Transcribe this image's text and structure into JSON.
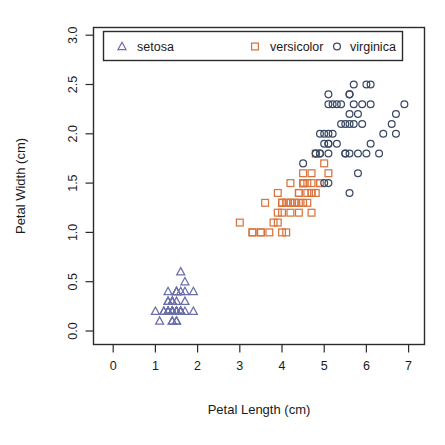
{
  "chart_data": {
    "type": "scatter",
    "title": "",
    "xlabel": "Petal Length (cm)",
    "ylabel": "Petal Width (cm)",
    "xlim": [
      -0.15,
      7.6
    ],
    "ylim": [
      -0.18,
      3.15
    ],
    "xticks": [
      "0",
      "1",
      "2",
      "3",
      "4",
      "5",
      "6",
      "7"
    ],
    "xtick_values": [
      0,
      1,
      2,
      3,
      4,
      5,
      6,
      7
    ],
    "yticks": [
      "0.0",
      "0.5",
      "1.0",
      "1.5",
      "2.0",
      "2.5",
      "3.0"
    ],
    "ytick_values": [
      0.0,
      0.5,
      1.0,
      1.5,
      2.0,
      2.5,
      3.0
    ],
    "grid": false,
    "legend_position": "top-inside",
    "legend_entries": [
      {
        "label": "setosa",
        "marker": "triangle",
        "color": "#6b6fa8"
      },
      {
        "label": "versicolor",
        "marker": "square",
        "color": "#d9743f"
      },
      {
        "label": "virginica",
        "marker": "circle",
        "color": "#3b4a63"
      }
    ],
    "series": [
      {
        "name": "setosa",
        "marker": "triangle",
        "color": "#6b6fa8",
        "points": [
          [
            1.4,
            0.2
          ],
          [
            1.4,
            0.2
          ],
          [
            1.3,
            0.2
          ],
          [
            1.5,
            0.2
          ],
          [
            1.4,
            0.2
          ],
          [
            1.7,
            0.4
          ],
          [
            1.4,
            0.3
          ],
          [
            1.5,
            0.2
          ],
          [
            1.4,
            0.2
          ],
          [
            1.5,
            0.1
          ],
          [
            1.5,
            0.2
          ],
          [
            1.6,
            0.2
          ],
          [
            1.4,
            0.1
          ],
          [
            1.1,
            0.1
          ],
          [
            1.2,
            0.2
          ],
          [
            1.5,
            0.4
          ],
          [
            1.3,
            0.4
          ],
          [
            1.4,
            0.3
          ],
          [
            1.7,
            0.3
          ],
          [
            1.5,
            0.3
          ],
          [
            1.7,
            0.2
          ],
          [
            1.5,
            0.4
          ],
          [
            1.0,
            0.2
          ],
          [
            1.7,
            0.5
          ],
          [
            1.9,
            0.2
          ],
          [
            1.6,
            0.2
          ],
          [
            1.6,
            0.4
          ],
          [
            1.5,
            0.2
          ],
          [
            1.4,
            0.2
          ],
          [
            1.6,
            0.2
          ],
          [
            1.6,
            0.2
          ],
          [
            1.5,
            0.4
          ],
          [
            1.5,
            0.1
          ],
          [
            1.4,
            0.2
          ],
          [
            1.5,
            0.2
          ],
          [
            1.2,
            0.2
          ],
          [
            1.3,
            0.2
          ],
          [
            1.4,
            0.1
          ],
          [
            1.3,
            0.2
          ],
          [
            1.5,
            0.2
          ],
          [
            1.3,
            0.3
          ],
          [
            1.3,
            0.3
          ],
          [
            1.3,
            0.2
          ],
          [
            1.6,
            0.6
          ],
          [
            1.9,
            0.4
          ],
          [
            1.4,
            0.3
          ],
          [
            1.6,
            0.2
          ],
          [
            1.4,
            0.2
          ],
          [
            1.5,
            0.2
          ],
          [
            1.4,
            0.2
          ]
        ]
      },
      {
        "name": "versicolor",
        "marker": "square",
        "color": "#d9743f",
        "points": [
          [
            4.7,
            1.4
          ],
          [
            4.5,
            1.5
          ],
          [
            4.9,
            1.5
          ],
          [
            4.0,
            1.3
          ],
          [
            4.6,
            1.5
          ],
          [
            4.5,
            1.3
          ],
          [
            4.7,
            1.6
          ],
          [
            3.3,
            1.0
          ],
          [
            4.6,
            1.3
          ],
          [
            3.9,
            1.4
          ],
          [
            3.5,
            1.0
          ],
          [
            4.2,
            1.5
          ],
          [
            4.0,
            1.0
          ],
          [
            4.7,
            1.4
          ],
          [
            3.6,
            1.3
          ],
          [
            4.4,
            1.4
          ],
          [
            4.5,
            1.5
          ],
          [
            4.1,
            1.0
          ],
          [
            4.5,
            1.5
          ],
          [
            3.9,
            1.1
          ],
          [
            4.8,
            1.8
          ],
          [
            4.0,
            1.3
          ],
          [
            4.9,
            1.5
          ],
          [
            4.7,
            1.2
          ],
          [
            4.3,
            1.3
          ],
          [
            4.4,
            1.4
          ],
          [
            4.8,
            1.4
          ],
          [
            5.0,
            1.7
          ],
          [
            4.5,
            1.5
          ],
          [
            3.5,
            1.0
          ],
          [
            3.8,
            1.1
          ],
          [
            3.7,
            1.0
          ],
          [
            3.9,
            1.2
          ],
          [
            5.1,
            1.6
          ],
          [
            4.5,
            1.5
          ],
          [
            4.5,
            1.6
          ],
          [
            4.7,
            1.5
          ],
          [
            4.4,
            1.3
          ],
          [
            4.1,
            1.3
          ],
          [
            4.0,
            1.3
          ],
          [
            4.4,
            1.2
          ],
          [
            4.6,
            1.4
          ],
          [
            4.0,
            1.2
          ],
          [
            3.3,
            1.0
          ],
          [
            4.2,
            1.3
          ],
          [
            4.2,
            1.2
          ],
          [
            4.2,
            1.3
          ],
          [
            4.3,
            1.3
          ],
          [
            3.0,
            1.1
          ],
          [
            4.1,
            1.3
          ]
        ]
      },
      {
        "name": "virginica",
        "marker": "circle",
        "color": "#3b4a63",
        "points": [
          [
            6.0,
            2.5
          ],
          [
            5.1,
            1.9
          ],
          [
            5.9,
            2.1
          ],
          [
            5.6,
            1.8
          ],
          [
            5.8,
            2.2
          ],
          [
            6.6,
            2.1
          ],
          [
            4.5,
            1.7
          ],
          [
            6.3,
            1.8
          ],
          [
            5.8,
            1.8
          ],
          [
            6.1,
            2.5
          ],
          [
            5.1,
            2.0
          ],
          [
            5.3,
            1.9
          ],
          [
            5.5,
            2.1
          ],
          [
            5.0,
            2.0
          ],
          [
            5.1,
            2.4
          ],
          [
            5.3,
            2.3
          ],
          [
            5.5,
            1.8
          ],
          [
            6.7,
            2.2
          ],
          [
            6.9,
            2.3
          ],
          [
            5.0,
            1.5
          ],
          [
            5.7,
            2.3
          ],
          [
            4.9,
            2.0
          ],
          [
            6.7,
            2.0
          ],
          [
            4.9,
            1.8
          ],
          [
            5.7,
            2.1
          ],
          [
            6.0,
            1.8
          ],
          [
            4.8,
            1.8
          ],
          [
            4.9,
            1.8
          ],
          [
            5.6,
            2.1
          ],
          [
            5.8,
            1.6
          ],
          [
            6.1,
            1.9
          ],
          [
            6.4,
            2.0
          ],
          [
            5.6,
            2.2
          ],
          [
            5.1,
            1.5
          ],
          [
            5.6,
            1.4
          ],
          [
            6.1,
            2.3
          ],
          [
            5.6,
            2.4
          ],
          [
            5.5,
            1.8
          ],
          [
            4.8,
            1.8
          ],
          [
            5.4,
            2.1
          ],
          [
            5.6,
            2.4
          ],
          [
            5.1,
            2.3
          ],
          [
            5.1,
            1.9
          ],
          [
            5.9,
            2.3
          ],
          [
            5.7,
            2.5
          ],
          [
            5.2,
            2.3
          ],
          [
            5.0,
            1.9
          ],
          [
            5.2,
            2.0
          ],
          [
            5.4,
            2.3
          ],
          [
            5.1,
            1.8
          ]
        ]
      }
    ]
  }
}
